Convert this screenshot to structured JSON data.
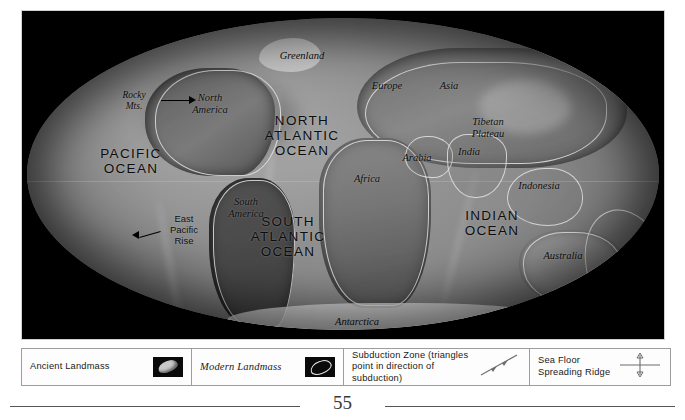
{
  "figure": {
    "kind": "paleogeographic-world-map",
    "projection_note": "oval world projection on black field",
    "ocean_labels": [
      {
        "id": "pacific",
        "text": "PACIFIC\nOCEAN"
      },
      {
        "id": "north_atlantic",
        "text": "NORTH\nATLANTIC\nOCEAN"
      },
      {
        "id": "south_atlantic",
        "text": "SOUTH\nATLANTIC\nOCEAN"
      },
      {
        "id": "indian",
        "text": "INDIAN\nOCEAN"
      }
    ],
    "region_labels": [
      {
        "id": "greenland",
        "text": "Greenland"
      },
      {
        "id": "europe",
        "text": "Europe"
      },
      {
        "id": "asia",
        "text": "Asia"
      },
      {
        "id": "north_america",
        "text": "North\nAmerica"
      },
      {
        "id": "tibetan_plateau",
        "text": "Tibetan\nPlateau"
      },
      {
        "id": "india",
        "text": "India"
      },
      {
        "id": "arabia",
        "text": "Arabia"
      },
      {
        "id": "africa",
        "text": "Africa"
      },
      {
        "id": "south_america",
        "text": "South\nAmerica"
      },
      {
        "id": "indonesia",
        "text": "Indonesia"
      },
      {
        "id": "australia",
        "text": "Australia"
      },
      {
        "id": "antarctica",
        "text": "Antarctica"
      }
    ],
    "feature_labels": [
      {
        "id": "rocky_mts",
        "text": "Rocky\nMts."
      },
      {
        "id": "east_pacific_rise",
        "text": "East\nPacific\nRise"
      }
    ],
    "colors": {
      "background": "#000000",
      "land": "#6f6f6f",
      "coastline": "#ebebeb",
      "label": "#0d0d0d",
      "ice": "#e6e6e6"
    }
  },
  "legend": {
    "items": [
      {
        "id": "ancient-landmass",
        "label": "Ancient Landmass",
        "icon": "filled-blob-swatch"
      },
      {
        "id": "modern-landmass",
        "label": "Modern Landmass",
        "icon": "hollow-blob-swatch"
      },
      {
        "id": "subduction-zone",
        "label": "Subduction Zone (triangles point\nin direction of subduction)",
        "icon": "subduction-line-icon"
      },
      {
        "id": "sea-floor-spreading",
        "label": "Sea Floor Spreading Ridge",
        "icon": "spreading-ridge-icon"
      }
    ]
  },
  "footer": {
    "page_number": "55"
  }
}
